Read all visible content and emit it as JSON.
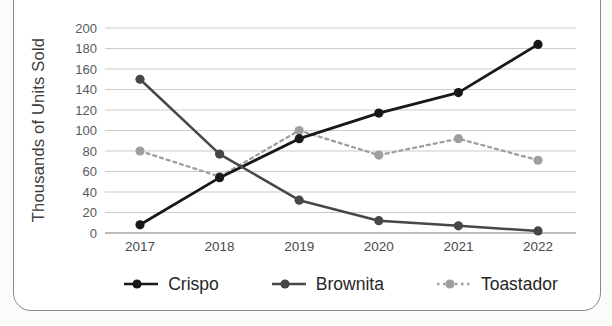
{
  "chart_data": {
    "type": "line",
    "title": "",
    "x": [
      "2017",
      "2018",
      "2019",
      "2020",
      "2021",
      "2022"
    ],
    "series": [
      {
        "name": "Crispo",
        "values": [
          8,
          54,
          92,
          117,
          137,
          184
        ],
        "color": "#181818",
        "line_style": "solid",
        "marker": "circle"
      },
      {
        "name": "Brownita",
        "values": [
          150,
          77,
          32,
          12,
          7,
          2
        ],
        "color": "#474747",
        "line_style": "solid",
        "marker": "circle"
      },
      {
        "name": "Toastador",
        "values": [
          80,
          55,
          100,
          76,
          92,
          71
        ],
        "color": "#9e9e9e",
        "line_style": "dashed",
        "marker": "circle"
      }
    ],
    "xlabel": "",
    "ylabel": "Thousands of Units Sold",
    "ylim": [
      0,
      200
    ],
    "yticks": [
      0,
      20,
      40,
      60,
      80,
      100,
      120,
      140,
      160,
      180,
      200
    ],
    "grid": true,
    "legend_position": "bottom"
  },
  "colors": {
    "grid": "#cbcbcb",
    "baseline": "#a6a6a6",
    "tick_label": "#5a5a5a",
    "axis_title": "#3c3c3c",
    "legend_text": "#262626",
    "card_border": "#8a8a8a",
    "card_bg": "#ffffff",
    "page_bg": "#fbfbfa"
  }
}
